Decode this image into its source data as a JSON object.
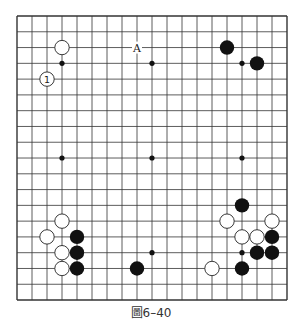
{
  "caption": "圖6–40",
  "board": {
    "size": 19,
    "origin_x": 17,
    "origin_y": 16,
    "step_x": 15.0,
    "step_y": 15.78,
    "stone_radius": 7.2,
    "line_color": "#333333",
    "black_color": "#111111",
    "white_fill": "#ffffff",
    "star_points": [
      [
        3,
        3
      ],
      [
        9,
        3
      ],
      [
        15,
        3
      ],
      [
        3,
        9
      ],
      [
        9,
        9
      ],
      [
        15,
        9
      ],
      [
        3,
        15
      ],
      [
        9,
        15
      ],
      [
        15,
        15
      ]
    ],
    "stones": [
      {
        "col": 3,
        "row": 2,
        "color": "white"
      },
      {
        "col": 2,
        "row": 4,
        "color": "white",
        "label": "1"
      },
      {
        "col": 14,
        "row": 2,
        "color": "black"
      },
      {
        "col": 16,
        "row": 3,
        "color": "black"
      },
      {
        "col": 3,
        "row": 13,
        "color": "white"
      },
      {
        "col": 2,
        "row": 14,
        "color": "white"
      },
      {
        "col": 4,
        "row": 14,
        "color": "black"
      },
      {
        "col": 3,
        "row": 15,
        "color": "white"
      },
      {
        "col": 4,
        "row": 15,
        "color": "black"
      },
      {
        "col": 3,
        "row": 16,
        "color": "white"
      },
      {
        "col": 4,
        "row": 16,
        "color": "black"
      },
      {
        "col": 8,
        "row": 16,
        "color": "black"
      },
      {
        "col": 15,
        "row": 12,
        "color": "black"
      },
      {
        "col": 14,
        "row": 13,
        "color": "white"
      },
      {
        "col": 17,
        "row": 13,
        "color": "white"
      },
      {
        "col": 15,
        "row": 14,
        "color": "white"
      },
      {
        "col": 16,
        "row": 14,
        "color": "white"
      },
      {
        "col": 17,
        "row": 14,
        "color": "black"
      },
      {
        "col": 16,
        "row": 15,
        "color": "black"
      },
      {
        "col": 17,
        "row": 15,
        "color": "black"
      },
      {
        "col": 15,
        "row": 16,
        "color": "black"
      },
      {
        "col": 13,
        "row": 16,
        "color": "white"
      }
    ],
    "labels": [
      {
        "col": 8,
        "row": 2,
        "text": "A"
      }
    ]
  }
}
